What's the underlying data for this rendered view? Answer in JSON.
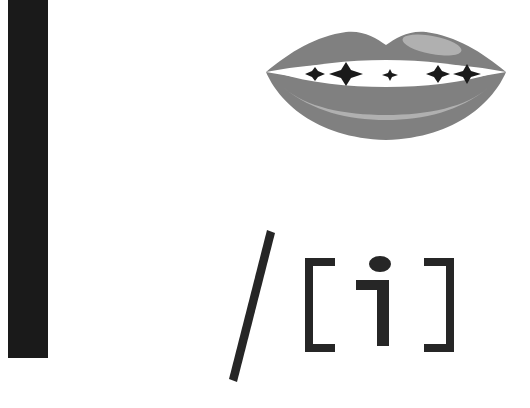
{
  "figure": {
    "background_color": "#ffffff",
    "width": 530,
    "height": 408
  },
  "black_bar": {
    "name": "black-vertical-bar",
    "color": "#1a1a1a",
    "x": 8,
    "y": 0,
    "width": 40,
    "height": 358
  },
  "lips": {
    "label": "sparkling lips illustration",
    "lip_color": "#808080",
    "highlight_color": "#b0b0b0",
    "teeth_color": "#ffffff",
    "sparkle_color": "#1a1a1a",
    "sparkle_count": 5,
    "sparkles": [
      {
        "cx": 53,
        "cy": 58,
        "rx": 10,
        "ry": 7
      },
      {
        "cx": 84,
        "cy": 58,
        "rx": 17,
        "ry": 12
      },
      {
        "cx": 128,
        "cy": 59,
        "rx": 8,
        "ry": 6
      },
      {
        "cx": 176,
        "cy": 58,
        "rx": 12,
        "ry": 9
      },
      {
        "cx": 205,
        "cy": 58,
        "rx": 14,
        "ry": 10
      }
    ]
  },
  "notation": {
    "label": "phonetic transcription",
    "text_color": "#262626",
    "slash": "/",
    "bracket_open": "[",
    "vowel": "i",
    "bracket_close": "]",
    "full_text": "/ [ i ]"
  }
}
